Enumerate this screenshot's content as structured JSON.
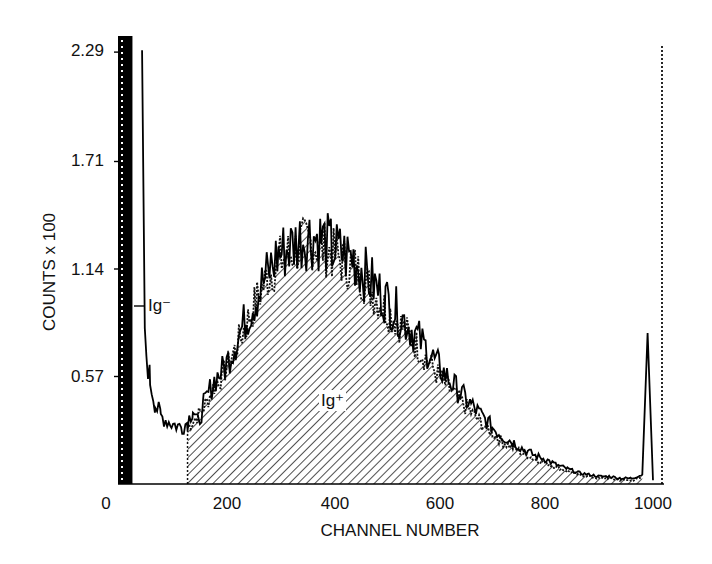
{
  "chart_data": {
    "type": "line",
    "title": "",
    "xlabel": "CHANNEL NUMBER",
    "ylabel": "COUNTS x 100",
    "xlim": [
      0,
      1020
    ],
    "ylim": [
      0,
      2.35
    ],
    "x_ticks": [
      "0",
      "200",
      "400",
      "600",
      "800",
      "1000"
    ],
    "y_ticks": [
      "0.57",
      "1.14",
      "1.71",
      "2.29"
    ],
    "grid": false,
    "legend": null,
    "annotations": [
      {
        "text": "Ig⁻",
        "target": "tall peak at channel ~20-45 (off scale)"
      },
      {
        "text": "Ig⁺",
        "target": "hatched region under broad distribution, channel ~130-990"
      }
    ],
    "gate_marker": {
      "style": "dotted vertical line",
      "channel": 1020
    },
    "series": [
      {
        "name": "solid histogram",
        "style": "solid",
        "x": [
          0,
          20,
          45,
          50,
          60,
          70,
          80,
          100,
          120,
          130,
          140,
          150,
          160,
          180,
          200,
          220,
          240,
          260,
          280,
          300,
          320,
          340,
          360,
          380,
          400,
          420,
          440,
          460,
          480,
          500,
          520,
          540,
          560,
          580,
          600,
          620,
          640,
          660,
          680,
          700,
          720,
          740,
          760,
          780,
          800,
          820,
          840,
          860,
          880,
          900,
          920,
          940,
          960,
          980,
          990,
          1000
        ],
        "values": [
          0,
          2.35,
          2.35,
          0.75,
          0.55,
          0.42,
          0.36,
          0.32,
          0.3,
          0.33,
          0.4,
          0.32,
          0.42,
          0.55,
          0.62,
          0.75,
          0.88,
          1.0,
          1.12,
          1.22,
          1.25,
          1.3,
          1.32,
          1.3,
          1.25,
          1.22,
          1.2,
          1.12,
          1.05,
          0.98,
          0.92,
          0.85,
          0.78,
          0.7,
          0.62,
          0.55,
          0.48,
          0.42,
          0.36,
          0.3,
          0.25,
          0.22,
          0.18,
          0.15,
          0.13,
          0.1,
          0.08,
          0.06,
          0.05,
          0.04,
          0.04,
          0.03,
          0.03,
          0.05,
          0.8,
          0.02
        ]
      },
      {
        "name": "dotted histogram (Ig+ gated, hatched)",
        "style": "dotted",
        "x": [
          130,
          160,
          180,
          200,
          220,
          240,
          260,
          280,
          300,
          320,
          340,
          360,
          380,
          400,
          420,
          440,
          460,
          480,
          500,
          520,
          540,
          560,
          580,
          600,
          620,
          640,
          660,
          680,
          700,
          720,
          740,
          760,
          780,
          800,
          820,
          840,
          860,
          880,
          900,
          920,
          940,
          960,
          980
        ],
        "values": [
          0.3,
          0.4,
          0.52,
          0.6,
          0.72,
          0.85,
          0.98,
          1.1,
          1.18,
          1.22,
          1.26,
          1.28,
          1.26,
          1.22,
          1.18,
          1.15,
          1.08,
          1.0,
          0.93,
          0.87,
          0.8,
          0.73,
          0.65,
          0.57,
          0.5,
          0.44,
          0.38,
          0.32,
          0.27,
          0.22,
          0.19,
          0.16,
          0.13,
          0.11,
          0.09,
          0.07,
          0.05,
          0.04,
          0.03,
          0.03,
          0.02,
          0.02,
          0.03
        ]
      }
    ]
  },
  "labels": {
    "ig_minus": "Ig⁻",
    "ig_plus": "Ig⁺",
    "xlabel": "CHANNEL NUMBER",
    "ylabel": "COUNTS x 100",
    "y_ticks": [
      "0.57",
      "1.14",
      "1.71",
      "2.29"
    ],
    "x_ticks": [
      "0",
      "200",
      "400",
      "600",
      "800",
      "1000"
    ]
  }
}
